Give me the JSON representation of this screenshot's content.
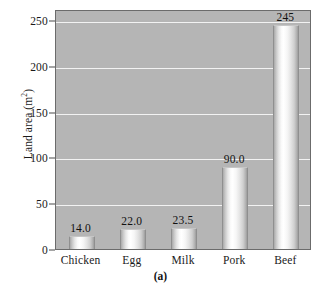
{
  "chart_data": {
    "type": "bar",
    "title": "",
    "subtitle": "",
    "xlabel": "",
    "ylabel": "Land area (m",
    "ylabel_sup": "2",
    "ylabel_tail": ")",
    "categories": [
      "Chicken",
      "Egg",
      "Milk",
      "Pork",
      "Beef"
    ],
    "values": [
      14.0,
      22.0,
      23.5,
      90.0,
      245
    ],
    "value_labels": [
      "14.0",
      "22.0",
      "23.5",
      "90.0",
      "245"
    ],
    "ylim": [
      0,
      262
    ],
    "yticks": [
      0,
      50,
      100,
      150,
      200,
      250
    ],
    "ytick_labels": [
      "0",
      "50",
      "100",
      "150",
      "200",
      "250"
    ],
    "grid": true,
    "grid_color": "#f2f2f2",
    "legend": "none",
    "plot_background": "#b5b5b5",
    "bar_color": "#ffffff",
    "axis_color": "#4a4a4a",
    "caption": "(a)"
  }
}
